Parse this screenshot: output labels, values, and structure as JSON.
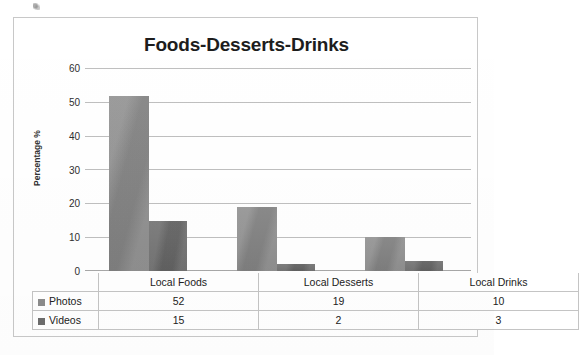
{
  "chart_data": {
    "type": "bar",
    "title": "Foods-Desserts-Drinks",
    "xlabel": "",
    "ylabel": "Percentage %",
    "categories": [
      "Local Foods",
      "Local Desserts",
      "Local Drinks"
    ],
    "series": [
      {
        "name": "Photos",
        "values": [
          52,
          19,
          10
        ],
        "color": "#8b8b8b"
      },
      {
        "name": "Videos",
        "values": [
          15,
          2,
          3
        ],
        "color": "#6c6c6c"
      }
    ],
    "ylim": [
      0,
      60
    ],
    "yticks": [
      0,
      10,
      20,
      30,
      40,
      50,
      60
    ],
    "ytick_labels": [
      "0",
      "10",
      "20",
      "30",
      "40",
      "50",
      "60"
    ],
    "grid": true,
    "grid_axis": "y",
    "legend": "data-table",
    "legend_position": "bottom-left",
    "data_table_visible": true
  },
  "table": {
    "header_cells": [
      "",
      "Local Foods",
      "Local Desserts",
      "Local Drinks"
    ],
    "rows": [
      {
        "label": "Photos",
        "swatch": "photos-swatch",
        "cells": [
          "52",
          "19",
          "10"
        ]
      },
      {
        "label": "Videos",
        "swatch": "videos-swatch",
        "cells": [
          "15",
          "2",
          "3"
        ]
      }
    ]
  },
  "colors": {
    "photos": "#8b8b8b",
    "videos": "#6c6c6c",
    "gridline": "#bfbfbf",
    "frame_border": "#c8c8c8",
    "table_border": "#c4c4c4",
    "background": "#ffffff",
    "text": "#222222"
  }
}
